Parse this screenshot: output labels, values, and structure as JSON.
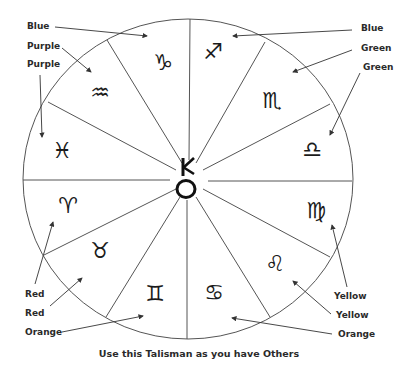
{
  "diagram": {
    "caption": "Use this Talisman as you have Others",
    "center_symbol": {
      "name": "chiron",
      "glyph": "⚷"
    },
    "wheel": {
      "cx": 188,
      "cy": 179,
      "rx": 165,
      "ry": 160
    },
    "signs": [
      {
        "name": "capricorn",
        "glyph": "♑",
        "x": 163,
        "y": 62
      },
      {
        "name": "sagittarius",
        "glyph": "♐",
        "x": 213,
        "y": 51
      },
      {
        "name": "scorpio",
        "glyph": "♏",
        "x": 272,
        "y": 100
      },
      {
        "name": "libra",
        "glyph": "♎",
        "x": 312,
        "y": 149
      },
      {
        "name": "virgo",
        "glyph": "♍",
        "x": 316,
        "y": 210
      },
      {
        "name": "leo",
        "glyph": "♌",
        "x": 275,
        "y": 263
      },
      {
        "name": "cancer",
        "glyph": "♋",
        "x": 214,
        "y": 292
      },
      {
        "name": "gemini",
        "glyph": "♊",
        "x": 155,
        "y": 293
      },
      {
        "name": "taurus",
        "glyph": "♉",
        "x": 100,
        "y": 250
      },
      {
        "name": "aries",
        "glyph": "♈",
        "x": 68,
        "y": 205
      },
      {
        "name": "pisces",
        "glyph": "♓",
        "x": 62,
        "y": 150
      },
      {
        "name": "aquarius",
        "glyph": "♒",
        "x": 100,
        "y": 92
      }
    ],
    "labels": [
      {
        "text": "Blue",
        "sign": "capricorn",
        "x": 27,
        "y": 29
      },
      {
        "text": "Purple",
        "sign": "aquarius",
        "x": 27,
        "y": 49
      },
      {
        "text": "Purple",
        "sign": "pisces",
        "x": 27,
        "y": 67
      },
      {
        "text": "Blue",
        "sign": "sagittarius",
        "x": 361,
        "y": 31
      },
      {
        "text": "Green",
        "sign": "scorpio",
        "x": 361,
        "y": 51
      },
      {
        "text": "Green",
        "sign": "libra",
        "x": 363,
        "y": 70
      },
      {
        "text": "Red",
        "sign": "aries",
        "x": 25,
        "y": 297
      },
      {
        "text": "Red",
        "sign": "taurus",
        "x": 25,
        "y": 316
      },
      {
        "text": "Orange",
        "sign": "gemini",
        "x": 25,
        "y": 335
      },
      {
        "text": "Yellow",
        "sign": "virgo",
        "x": 334,
        "y": 299
      },
      {
        "text": "Yellow",
        "sign": "leo",
        "x": 336,
        "y": 318
      },
      {
        "text": "Orange",
        "sign": "cancer",
        "x": 338,
        "y": 337
      }
    ]
  }
}
